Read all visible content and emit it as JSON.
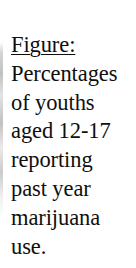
{
  "document": {
    "type": "scanned-figure-caption",
    "background_color": "#ffffff",
    "text_color": "#100f0d"
  },
  "caption": {
    "label": "Figure:",
    "label_underlined": true,
    "full_text": "Figure: Percentages of youths aged 12-17 reporting past year marijuana use.",
    "lines": [
      "Figure:",
      "Percentages",
      "of youths",
      "aged 12-17",
      "reporting",
      "past year",
      "marijuana",
      "use."
    ],
    "body_lines": [
      "Percentages",
      "of youths",
      "aged 12-17",
      "reporting",
      "past year",
      "marijuana",
      "use."
    ],
    "subject": "youths",
    "age_range": "12-17",
    "measure": "Percentages",
    "period": "past year",
    "substance": "marijuana",
    "outcome": "use"
  },
  "artifacts": {
    "left_edge_smudge": "scan-edge-artifact"
  }
}
